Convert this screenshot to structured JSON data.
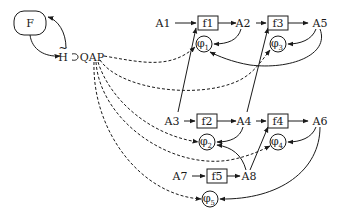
{
  "diagram": {
    "nodes": {
      "F": {
        "label": "F",
        "shape": "rounded-rect",
        "x": 14,
        "y": 11,
        "w": 32,
        "h": 24
      },
      "H": {
        "label": "H",
        "accent": "~",
        "x": 63,
        "y": 57
      },
      "QAP": {
        "label": "QAP",
        "x": 92,
        "y": 57
      },
      "A1": {
        "label": "A1",
        "x": 163,
        "y": 23
      },
      "f1": {
        "label": "f1",
        "shape": "rect",
        "x": 198,
        "y": 16,
        "w": 20,
        "h": 14
      },
      "A2": {
        "label": "A2",
        "x": 243,
        "y": 23
      },
      "f3": {
        "label": "f3",
        "shape": "rect",
        "x": 268,
        "y": 16,
        "w": 20,
        "h": 14
      },
      "A5": {
        "label": "A5",
        "x": 320,
        "y": 23
      },
      "phi1": {
        "label": "φ",
        "sub": "1",
        "shape": "circle",
        "cx": 204,
        "cy": 44,
        "r": 8
      },
      "phi3": {
        "label": "φ",
        "sub": "3",
        "shape": "circle",
        "cx": 278,
        "cy": 44,
        "r": 8
      },
      "A3": {
        "label": "A3",
        "x": 172,
        "y": 121
      },
      "f2": {
        "label": "f2",
        "shape": "rect",
        "x": 197,
        "y": 114,
        "w": 20,
        "h": 14
      },
      "A4": {
        "label": "A4",
        "x": 244,
        "y": 121
      },
      "f4": {
        "label": "f4",
        "shape": "rect",
        "x": 268,
        "y": 114,
        "w": 20,
        "h": 14
      },
      "A6": {
        "label": "A6",
        "x": 320,
        "y": 121
      },
      "phi2": {
        "label": "φ",
        "sub": "2",
        "shape": "circle",
        "cx": 207,
        "cy": 142,
        "r": 8
      },
      "phi4": {
        "label": "φ",
        "sub": "4",
        "shape": "circle",
        "cx": 278,
        "cy": 142,
        "r": 8
      },
      "A7": {
        "label": "A7",
        "x": 180,
        "y": 176
      },
      "f5": {
        "label": "f5",
        "shape": "rect",
        "x": 207,
        "y": 169,
        "w": 20,
        "h": 14
      },
      "A8": {
        "label": "A8",
        "x": 249,
        "y": 176
      },
      "phi5": {
        "label": "φ",
        "sub": "5",
        "shape": "circle",
        "cx": 210,
        "cy": 199,
        "r": 8
      }
    },
    "edges_solid": [
      {
        "from": "F",
        "to": "H",
        "d": "M 30 35 C 32 50, 45 57, 60 56"
      },
      {
        "from": "H",
        "to": "F",
        "d": "M 66 48 C 66 32, 58 20, 48 17"
      },
      {
        "from": "A1",
        "to": "f1",
        "d": "M 175 23 L 196 23"
      },
      {
        "from": "f1",
        "to": "A2",
        "d": "M 218 23 L 236 23"
      },
      {
        "from": "A2",
        "to": "f3",
        "d": "M 256 23 L 266 23"
      },
      {
        "from": "f3",
        "to": "A5",
        "d": "M 288 23 L 308 23"
      },
      {
        "from": "A2",
        "to": "phi1",
        "d": "M 241 29 C 238 40, 228 44, 214 44"
      },
      {
        "from": "A5",
        "to": "phi3",
        "d": "M 316 29 C 312 40, 300 44, 288 44"
      },
      {
        "from": "A5",
        "to": "phi1",
        "d": "M 320 29 C 330 55, 290 70, 250 65 C 232 62, 218 56, 210 52"
      },
      {
        "from": "A3",
        "to": "f1",
        "d": "M 178 112 L 196 28"
      },
      {
        "from": "A3",
        "to": "f2",
        "d": "M 184 121 L 195 121"
      },
      {
        "from": "f2",
        "to": "A4",
        "d": "M 217 121 L 236 121"
      },
      {
        "from": "A4",
        "to": "f3",
        "d": "M 247 112 L 268 28"
      },
      {
        "from": "A4",
        "to": "f4",
        "d": "M 256 121 L 266 121"
      },
      {
        "from": "f4",
        "to": "A6",
        "d": "M 288 121 L 308 121"
      },
      {
        "from": "A4",
        "to": "phi2",
        "d": "M 243 127 C 240 138, 230 142, 217 142"
      },
      {
        "from": "A6",
        "to": "phi4",
        "d": "M 316 127 C 312 138, 300 142, 288 142"
      },
      {
        "from": "A7",
        "to": "f5",
        "d": "M 192 176 L 205 176"
      },
      {
        "from": "f5",
        "to": "A8",
        "d": "M 227 176 L 240 176"
      },
      {
        "from": "A8",
        "to": "phi2",
        "d": "M 246 170 C 242 155, 232 147, 217 145"
      },
      {
        "from": "A8",
        "to": "f4",
        "d": "M 250 170 L 268 127"
      },
      {
        "from": "A6",
        "to": "phi5",
        "d": "M 320 127 C 320 170, 280 200, 220 199"
      }
    ],
    "edges_dashed": [
      {
        "from": "QAP",
        "to": "phi1",
        "d": "M 104 56 C 140 62, 170 70, 195 47"
      },
      {
        "from": "QAP",
        "to": "phi3",
        "d": "M 100 60 C 120 90, 200 100, 240 80 C 255 72, 262 60, 270 50"
      },
      {
        "from": "QAP",
        "to": "phi2",
        "d": "M 98 62 C 110 100, 150 135, 198 142"
      },
      {
        "from": "QAP",
        "to": "phi4",
        "d": "M 96 62 C 100 120, 170 170, 230 160 C 250 156, 262 150, 270 146"
      },
      {
        "from": "QAP",
        "to": "phi5",
        "d": "M 94 62 C 92 130, 140 195, 201 199"
      }
    ],
    "h_loop": {
      "d": "M 72 54 C 80 52, 80 62, 72 60"
    }
  }
}
